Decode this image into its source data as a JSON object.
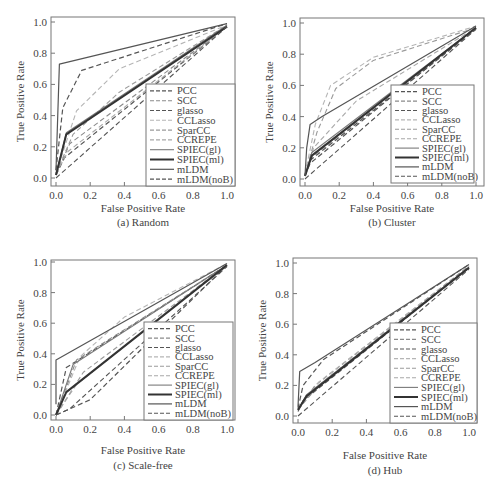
{
  "figure": {
    "legend_labels": [
      "PCC",
      "SCC",
      "glasso",
      "CCLasso",
      "SparCC",
      "CCREPE",
      "SPIEC(gl)",
      "SPIEC(ml)",
      "mLDM",
      "mLDM(noB)"
    ]
  },
  "chart_data": [
    {
      "type": "line",
      "id": "a",
      "title": "(a)  Random",
      "xlabel": "False Positive Rate",
      "ylabel": "True Positive Rate",
      "xlim": [
        0,
        1
      ],
      "ylim": [
        0,
        1
      ],
      "xticks": [
        "0.0",
        "0.2",
        "0.4",
        "0.6",
        "0.8",
        "1.0"
      ],
      "yticks": [
        "0.0",
        "0.2",
        "0.4",
        "0.6",
        "0.8",
        "1.0"
      ],
      "grid": false,
      "legend_position": "lower right",
      "series": [
        {
          "name": "PCC",
          "style": "dash",
          "color": "#555555",
          "width": 1.2,
          "x": [
            0,
            0.05,
            1
          ],
          "y": [
            0.02,
            0.13,
            0.97
          ]
        },
        {
          "name": "SCC",
          "style": "dash",
          "color": "#8a8a8a",
          "width": 1.1,
          "x": [
            0,
            0.08,
            1
          ],
          "y": [
            0.02,
            0.22,
            0.97
          ]
        },
        {
          "name": "glasso",
          "style": "dash",
          "color": "#555555",
          "width": 1.2,
          "x": [
            0,
            0.04,
            0.15,
            1
          ],
          "y": [
            0.05,
            0.45,
            0.69,
            0.99
          ]
        },
        {
          "name": "CCLasso",
          "style": "dash",
          "color": "#b5b5b5",
          "width": 1.1,
          "x": [
            0,
            0.12,
            0.37,
            1
          ],
          "y": [
            0.03,
            0.43,
            0.7,
            0.98
          ]
        },
        {
          "name": "SparCC",
          "style": "dash",
          "color": "#9a9a9a",
          "width": 1.1,
          "x": [
            0,
            0.1,
            0.37,
            1
          ],
          "y": [
            0.03,
            0.28,
            0.55,
            0.98
          ]
        },
        {
          "name": "CCREPE",
          "style": "dash",
          "color": "#a8a8a8",
          "width": 1.1,
          "x": [
            0,
            0.07,
            1
          ],
          "y": [
            0.03,
            0.17,
            0.97
          ]
        },
        {
          "name": "SPIEC(gl)",
          "style": "solid",
          "color": "#7a7a7a",
          "width": 1.1,
          "x": [
            0,
            0.06,
            1
          ],
          "y": [
            0.02,
            0.29,
            0.98
          ]
        },
        {
          "name": "SPIEC(ml)",
          "style": "solid",
          "color": "#333333",
          "width": 2.0,
          "x": [
            0,
            0.06,
            1
          ],
          "y": [
            0.02,
            0.28,
            0.97
          ]
        },
        {
          "name": "mLDM",
          "style": "solid",
          "color": "#555555",
          "width": 1.2,
          "x": [
            0,
            0.02,
            1
          ],
          "y": [
            0.05,
            0.73,
            0.99
          ]
        },
        {
          "name": "mLDM(noB)",
          "style": "dash",
          "color": "#555555",
          "width": 1.1,
          "x": [
            0,
            1
          ],
          "y": [
            0,
            0.97
          ]
        }
      ]
    },
    {
      "type": "line",
      "id": "b",
      "title": "(b)  Cluster",
      "xlabel": "False Positive Rate",
      "ylabel": "True Positive Rate",
      "xlim": [
        0,
        1
      ],
      "ylim": [
        0,
        1
      ],
      "xticks": [
        "0.0",
        "0.2",
        "0.4",
        "0.6",
        "0.8",
        "1.0"
      ],
      "yticks": [
        "0.0",
        "0.2",
        "0.4",
        "0.6",
        "0.8",
        "1.0"
      ],
      "grid": false,
      "legend_position": "lower right",
      "series": [
        {
          "name": "PCC",
          "style": "dash",
          "color": "#555555",
          "width": 1.2,
          "x": [
            0,
            0.03,
            1
          ],
          "y": [
            0.02,
            0.1,
            0.97
          ]
        },
        {
          "name": "SCC",
          "style": "dash",
          "color": "#8a8a8a",
          "width": 1.1,
          "x": [
            0,
            0.04,
            1
          ],
          "y": [
            0.02,
            0.14,
            0.97
          ]
        },
        {
          "name": "glasso",
          "style": "dash",
          "color": "#555555",
          "width": 1.2,
          "x": [
            0,
            0.03,
            1
          ],
          "y": [
            0.02,
            0.12,
            0.96
          ]
        },
        {
          "name": "CCLasso",
          "style": "dash",
          "color": "#b5b5b5",
          "width": 1.1,
          "x": [
            0,
            0.06,
            0.15,
            0.4,
            1
          ],
          "y": [
            0.03,
            0.35,
            0.6,
            0.78,
            0.98
          ]
        },
        {
          "name": "SparCC",
          "style": "dash",
          "color": "#9a9a9a",
          "width": 1.1,
          "x": [
            0,
            0.07,
            0.18,
            0.4,
            1
          ],
          "y": [
            0.03,
            0.3,
            0.58,
            0.76,
            0.97
          ]
        },
        {
          "name": "CCREPE",
          "style": "dash",
          "color": "#a8a8a8",
          "width": 1.1,
          "x": [
            0,
            0.05,
            0.3,
            1
          ],
          "y": [
            0.02,
            0.2,
            0.5,
            0.97
          ]
        },
        {
          "name": "SPIEC(gl)",
          "style": "solid",
          "color": "#7a7a7a",
          "width": 1.1,
          "x": [
            0,
            0.04,
            1
          ],
          "y": [
            0.02,
            0.17,
            0.97
          ]
        },
        {
          "name": "SPIEC(ml)",
          "style": "solid",
          "color": "#333333",
          "width": 2.0,
          "x": [
            0,
            0.04,
            1
          ],
          "y": [
            0.02,
            0.15,
            0.97
          ]
        },
        {
          "name": "mLDM",
          "style": "solid",
          "color": "#555555",
          "width": 1.2,
          "x": [
            0,
            0.01,
            0.03,
            0.1,
            1
          ],
          "y": [
            0.02,
            0.2,
            0.35,
            0.4,
            0.98
          ]
        },
        {
          "name": "mLDM(noB)",
          "style": "dash",
          "color": "#555555",
          "width": 1.1,
          "x": [
            0,
            1
          ],
          "y": [
            0,
            0.96
          ]
        }
      ]
    },
    {
      "type": "line",
      "id": "c",
      "title": "(c)  Scale-free",
      "xlabel": "False Positive Rate",
      "ylabel": "True Positive Rate",
      "xlim": [
        0,
        1
      ],
      "ylim": [
        0,
        1
      ],
      "xticks": [
        "0.0",
        "0.2",
        "0.4",
        "0.6",
        "0.8",
        "1.0"
      ],
      "yticks": [
        "0.0",
        "0.2",
        "0.4",
        "0.6",
        "0.8",
        "1.0"
      ],
      "grid": false,
      "legend_position": "lower right",
      "series": [
        {
          "name": "PCC",
          "style": "dash",
          "color": "#555555",
          "width": 1.2,
          "x": [
            0,
            0.06,
            1
          ],
          "y": [
            0,
            0.31,
            0.98
          ]
        },
        {
          "name": "SCC",
          "style": "dash",
          "color": "#8a8a8a",
          "width": 1.1,
          "x": [
            0,
            0.12,
            1
          ],
          "y": [
            0,
            0.36,
            0.98
          ]
        },
        {
          "name": "glasso",
          "style": "dash",
          "color": "#555555",
          "width": 1.2,
          "x": [
            0,
            0.2,
            1
          ],
          "y": [
            0,
            0.1,
            0.98
          ]
        },
        {
          "name": "CCLasso",
          "style": "dash",
          "color": "#b5b5b5",
          "width": 1.1,
          "x": [
            0,
            0.14,
            0.4,
            1
          ],
          "y": [
            0,
            0.38,
            0.64,
            0.99
          ]
        },
        {
          "name": "SparCC",
          "style": "dash",
          "color": "#9a9a9a",
          "width": 1.1,
          "x": [
            0,
            0.16,
            1
          ],
          "y": [
            0,
            0.28,
            0.98
          ]
        },
        {
          "name": "CCREPE",
          "style": "dash",
          "color": "#a8a8a8",
          "width": 1.1,
          "x": [
            0,
            0.12,
            1
          ],
          "y": [
            0,
            0.2,
            0.98
          ]
        },
        {
          "name": "SPIEC(gl)",
          "style": "solid",
          "color": "#7a7a7a",
          "width": 1.1,
          "x": [
            0,
            0.1,
            1
          ],
          "y": [
            0,
            0.33,
            0.98
          ]
        },
        {
          "name": "SPIEC(ml)",
          "style": "solid",
          "color": "#333333",
          "width": 2.0,
          "x": [
            0,
            0.06,
            1
          ],
          "y": [
            0,
            0.15,
            0.98
          ]
        },
        {
          "name": "mLDM",
          "style": "solid",
          "color": "#555555",
          "width": 1.2,
          "x": [
            0,
            0,
            1
          ],
          "y": [
            0.07,
            0.36,
            0.99
          ]
        },
        {
          "name": "mLDM(noB)",
          "style": "dash",
          "color": "#555555",
          "width": 1.1,
          "x": [
            0,
            0.08,
            1
          ],
          "y": [
            0,
            0.04,
            0.97
          ]
        }
      ]
    },
    {
      "type": "line",
      "id": "d",
      "title": "(d)  Hub",
      "xlabel": "False Positive Rate",
      "ylabel": "True Positive Rate",
      "xlim": [
        0,
        1
      ],
      "ylim": [
        0,
        1
      ],
      "xticks": [
        "0.0",
        "0.2",
        "0.4",
        "0.6",
        "0.8",
        "1.0"
      ],
      "yticks": [
        "0.0",
        "0.2",
        "0.4",
        "0.6",
        "0.8",
        "1.0"
      ],
      "grid": false,
      "legend_position": "lower right",
      "series": [
        {
          "name": "PCC",
          "style": "dash",
          "color": "#555555",
          "width": 1.2,
          "x": [
            0,
            0.03,
            1
          ],
          "y": [
            0.03,
            0.1,
            0.97
          ]
        },
        {
          "name": "SCC",
          "style": "dash",
          "color": "#8a8a8a",
          "width": 1.1,
          "x": [
            0,
            0.1,
            1
          ],
          "y": [
            0.04,
            0.2,
            0.98
          ]
        },
        {
          "name": "glasso",
          "style": "dash",
          "color": "#555555",
          "width": 1.2,
          "x": [
            0,
            0.03,
            0.15,
            1
          ],
          "y": [
            0.05,
            0.2,
            0.37,
            0.99
          ]
        },
        {
          "name": "CCLasso",
          "style": "dash",
          "color": "#b5b5b5",
          "width": 1.1,
          "x": [
            0,
            0.12,
            1
          ],
          "y": [
            0.04,
            0.22,
            0.98
          ]
        },
        {
          "name": "SparCC",
          "style": "dash",
          "color": "#9a9a9a",
          "width": 1.1,
          "x": [
            0,
            0.12,
            1
          ],
          "y": [
            0.04,
            0.2,
            0.98
          ]
        },
        {
          "name": "CCREPE",
          "style": "dash",
          "color": "#a8a8a8",
          "width": 1.1,
          "x": [
            0,
            0.08,
            1
          ],
          "y": [
            0.04,
            0.16,
            0.97
          ]
        },
        {
          "name": "SPIEC(gl)",
          "style": "solid",
          "color": "#7a7a7a",
          "width": 1.1,
          "x": [
            0,
            0.05,
            1
          ],
          "y": [
            0.04,
            0.14,
            0.97
          ]
        },
        {
          "name": "SPIEC(ml)",
          "style": "solid",
          "color": "#333333",
          "width": 2.0,
          "x": [
            0,
            0.05,
            1
          ],
          "y": [
            0.04,
            0.13,
            0.97
          ]
        },
        {
          "name": "mLDM",
          "style": "solid",
          "color": "#555555",
          "width": 1.2,
          "x": [
            0,
            0.01,
            0.1,
            1
          ],
          "y": [
            0.06,
            0.29,
            0.35,
            0.99
          ]
        },
        {
          "name": "mLDM(noB)",
          "style": "dash",
          "color": "#555555",
          "width": 1.1,
          "x": [
            0,
            1
          ],
          "y": [
            0,
            0.96
          ]
        }
      ]
    }
  ],
  "layout": {
    "panels": [
      {
        "frame": [
          51,
          17,
          235,
          186
        ],
        "plot": [
          56,
          22,
          227,
          178
        ],
        "legend": [
          146,
          84,
          235,
          186
        ],
        "caption_y": 214,
        "xlabel_y": 200
      },
      {
        "frame": [
          300,
          18,
          484,
          186
        ],
        "plot": [
          305,
          23,
          476,
          179
        ],
        "legend": [
          391,
          85,
          474,
          183
        ],
        "caption_y": 214,
        "xlabel_y": 200
      },
      {
        "frame": [
          51,
          260,
          235,
          420
        ],
        "plot": [
          56,
          262,
          227,
          415
        ],
        "legend": [
          144,
          322,
          233,
          420
        ],
        "caption_y": 457,
        "xlabel_y": 442
      },
      {
        "frame": [
          293,
          258,
          477,
          423
        ],
        "plot": [
          298,
          263,
          469,
          416
        ],
        "legend": [
          390,
          323,
          477,
          423
        ],
        "caption_y": 462,
        "xlabel_y": 447
      }
    ]
  }
}
